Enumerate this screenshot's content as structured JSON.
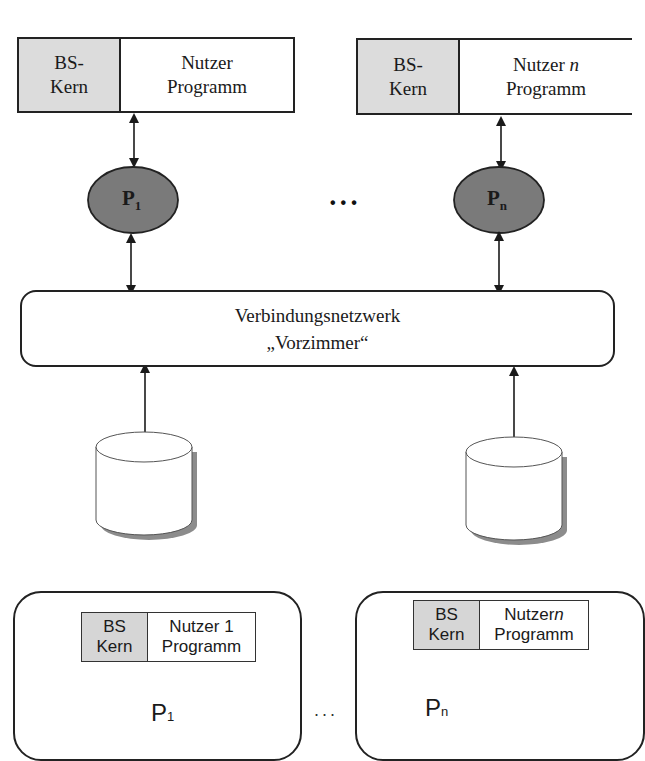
{
  "diagram": {
    "top": {
      "nodes": [
        {
          "kernel_label": "BS-\nKern",
          "program_label_line1": "Nutzer",
          "program_label_italic": "",
          "program_label_line2": "Programm",
          "processor": "P",
          "processor_sub": "1"
        },
        {
          "kernel_label": "BS-\nKern",
          "program_label_line1": "Nutzer ",
          "program_label_italic": "n",
          "program_label_line2": "Programm",
          "processor": "P",
          "processor_sub": "n"
        }
      ],
      "ellipsis": "•••",
      "network": {
        "line1": "Verbindungsnetzwerk",
        "line2": "„Vorzimmer“"
      },
      "storage": [
        "disk-1",
        "disk-n"
      ]
    },
    "bottom": {
      "nodes": [
        {
          "kernel_label": "BS\nKern",
          "program_label_line1": "Nutzer 1",
          "program_label_italic": "",
          "program_label_line2": "Programm",
          "processor": "P",
          "processor_sub": "1"
        },
        {
          "kernel_label": "BS\nKern",
          "program_label_line1": "Nutzer",
          "program_label_italic": "n",
          "program_label_line2": "Programm",
          "processor": "P",
          "processor_sub": "n"
        }
      ],
      "ellipsis": "..."
    },
    "colors": {
      "kernel_fill": "#dcdcdc",
      "processor_fill": "#7a7a7a",
      "stroke": "#222222",
      "shadow": "#8c8c8c"
    }
  }
}
